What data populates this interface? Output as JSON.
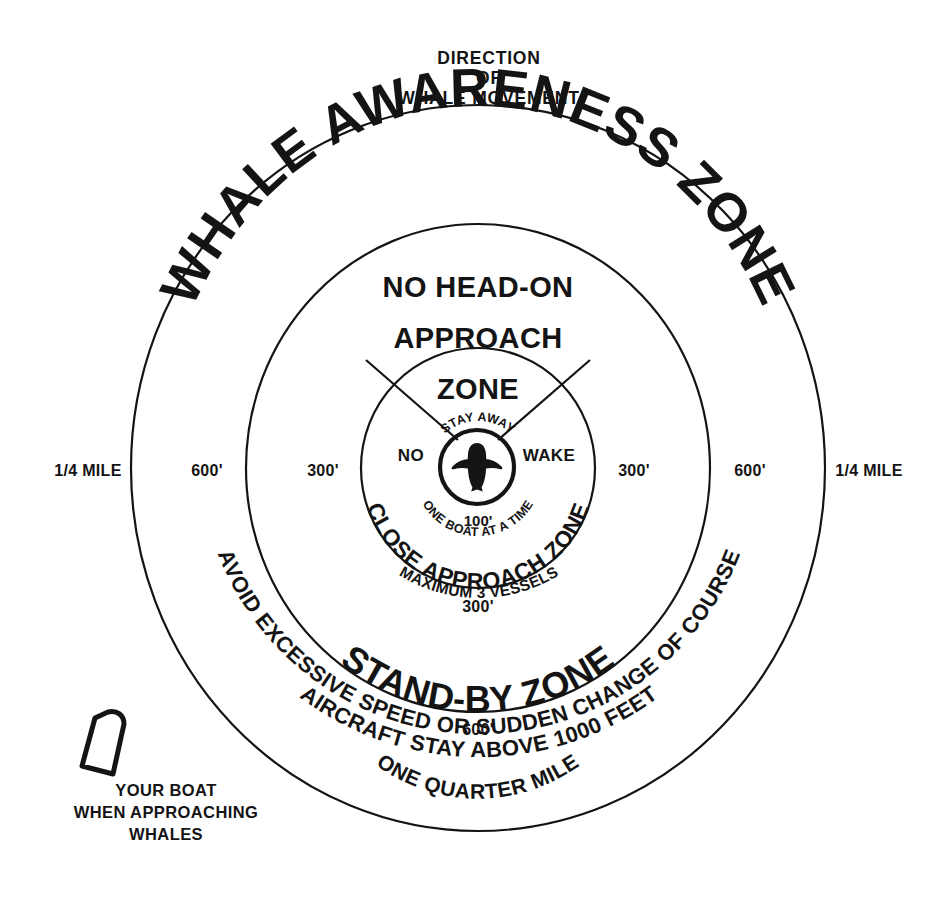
{
  "diagram": {
    "header": {
      "line1": "DIRECTION",
      "line2": "OF",
      "line3": "WHALE MOVEMENT"
    },
    "zones": [
      {
        "key": "whale_awareness",
        "label": "WHALE AWARENESS ZONE",
        "radius_label_left": "1/4 MILE",
        "radius_label_right": "1/4 MILE",
        "bottom_distance": "",
        "bottom_label": "ONE QUARTER MILE"
      },
      {
        "key": "stand_by",
        "label": "STAND-BY ZONE",
        "radius_label_left": "600'",
        "radius_label_right": "600'",
        "bottom_distance": "600'",
        "bottom_label": ""
      },
      {
        "key": "close_approach",
        "label": "CLOSE APPROACH ZONE",
        "radius_label_left": "300'",
        "radius_label_right": "300'",
        "bottom_distance": "300'",
        "bottom_label": "MAXIMUM 3 VESSELS"
      },
      {
        "key": "stay_away",
        "label": "STAY AWAY",
        "radius_label_left": "",
        "radius_label_right": "",
        "bottom_distance": "100'",
        "bottom_label": "ONE BOAT AT A TIME"
      }
    ],
    "wedge": {
      "line1": "NO HEAD-ON",
      "line2": "APPROACH",
      "line3": "ZONE"
    },
    "core": {
      "left_word": "NO",
      "right_word": "WAKE",
      "top_arc": "STAY AWAY",
      "bottom_arc": "ONE BOAT AT A TIME",
      "distance": "100'",
      "icon": "whale-icon"
    },
    "advisories": [
      "AVOID EXCESSIVE SPEED OR SUDDEN CHANGE OF COURSE",
      "AIRCRAFT STAY ABOVE 1000 FEET"
    ],
    "boat": {
      "icon": "boat-icon",
      "caption_line1": "YOUR BOAT",
      "caption_line2": "WHEN APPROACHING",
      "caption_line3": "WHALES"
    },
    "colors": {
      "ink": "#141414",
      "background": "#ffffff"
    }
  }
}
